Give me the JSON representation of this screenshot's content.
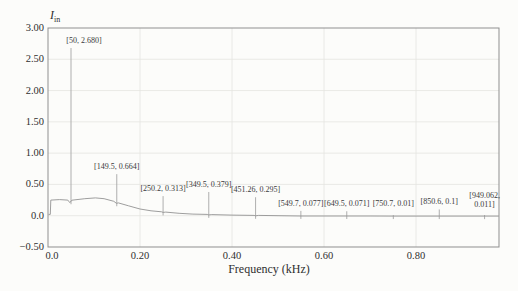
{
  "chart_data": {
    "type": "line",
    "title": "",
    "xlabel": "Frequency (kHz)",
    "ylabel_main": "I",
    "ylabel_sub": "in",
    "xlim": [
      0,
      0.98
    ],
    "ylim": [
      -0.5,
      3.0
    ],
    "grid": true,
    "x_ticks": [
      {
        "v": 0.0,
        "label": "0.0"
      },
      {
        "v": 0.2,
        "label": "0.20"
      },
      {
        "v": 0.4,
        "label": "0.40"
      },
      {
        "v": 0.6,
        "label": "0.60"
      },
      {
        "v": 0.8,
        "label": "0.80"
      }
    ],
    "y_ticks": [
      {
        "v": 3.0,
        "label": "3.00"
      },
      {
        "v": 2.5,
        "label": "2.50"
      },
      {
        "v": 2.0,
        "label": "2.00"
      },
      {
        "v": 1.5,
        "label": "1.50"
      },
      {
        "v": 1.0,
        "label": "1.00"
      },
      {
        "v": 0.5,
        "label": "0.50"
      },
      {
        "v": 0.0,
        "label": "0.0"
      },
      {
        "v": -0.5,
        "label": "−0.50"
      }
    ],
    "peaks": [
      {
        "freq_hz": 50,
        "freq_khz": 0.05,
        "amp": 2.68,
        "label": "[50, 2.680]"
      },
      {
        "freq_hz": 149.5,
        "freq_khz": 0.1495,
        "amp": 0.664,
        "label": "[149.5, 0.664]"
      },
      {
        "freq_hz": 250.2,
        "freq_khz": 0.2502,
        "amp": 0.313,
        "label": "[250.2, 0.313]"
      },
      {
        "freq_hz": 349.5,
        "freq_khz": 0.3495,
        "amp": 0.379,
        "label": "[349.5, 0.379]"
      },
      {
        "freq_hz": 451.26,
        "freq_khz": 0.45126,
        "amp": 0.295,
        "label": "[451.26, 0.295]"
      },
      {
        "freq_hz": 549.7,
        "freq_khz": 0.5497,
        "amp": 0.077,
        "label": "[549.7, 0.077]"
      },
      {
        "freq_hz": 649.5,
        "freq_khz": 0.6495,
        "amp": 0.071,
        "label": "[649.5, 0.071]"
      },
      {
        "freq_hz": 750.7,
        "freq_khz": 0.7507,
        "amp": 0.01,
        "label": "[750.7, 0.01]"
      },
      {
        "freq_hz": 850.6,
        "freq_khz": 0.8506,
        "amp": 0.1,
        "label": "[850.6, 0.1]"
      },
      {
        "freq_hz": 949.062,
        "freq_khz": 0.949062,
        "amp": 0.011,
        "label": "[949.062,\n0.011]"
      }
    ],
    "baseline": [
      [
        0.001,
        0.02
      ],
      [
        0.005,
        0.02
      ],
      [
        0.006,
        0.25
      ],
      [
        0.025,
        0.257
      ],
      [
        0.043,
        0.25
      ],
      [
        0.0475,
        0.21
      ],
      [
        0.052,
        0.248
      ],
      [
        0.08,
        0.272
      ],
      [
        0.103,
        0.285
      ],
      [
        0.122,
        0.272
      ],
      [
        0.143,
        0.23
      ],
      [
        0.1488,
        0.198
      ],
      [
        0.153,
        0.205
      ],
      [
        0.175,
        0.158
      ],
      [
        0.2,
        0.107
      ],
      [
        0.224,
        0.078
      ],
      [
        0.247,
        0.063
      ],
      [
        0.2502,
        0.052
      ],
      [
        0.256,
        0.057
      ],
      [
        0.285,
        0.038
      ],
      [
        0.315,
        0.026
      ],
      [
        0.346,
        0.02
      ],
      [
        0.3495,
        0.013
      ],
      [
        0.356,
        0.017
      ],
      [
        0.4,
        0.009
      ],
      [
        0.448,
        0.005
      ],
      [
        0.45126,
        -0.002
      ],
      [
        0.458,
        0.004
      ],
      [
        0.5,
        0.0
      ],
      [
        0.5497,
        -0.004
      ],
      [
        0.6,
        -0.004
      ],
      [
        0.6495,
        -0.005
      ],
      [
        0.7,
        -0.005
      ],
      [
        0.7507,
        -0.006
      ],
      [
        0.8,
        -0.006
      ],
      [
        0.8506,
        -0.006
      ],
      [
        0.9,
        -0.007
      ],
      [
        0.949062,
        -0.007
      ],
      [
        0.98,
        -0.007
      ]
    ],
    "colors": {
      "background": "#fcfcfa",
      "curve": "#939393",
      "spike": "#a6a6a6",
      "frame": "#8f8f8f",
      "grid": "#e5e5e1",
      "text": "#2f2f2f"
    }
  }
}
